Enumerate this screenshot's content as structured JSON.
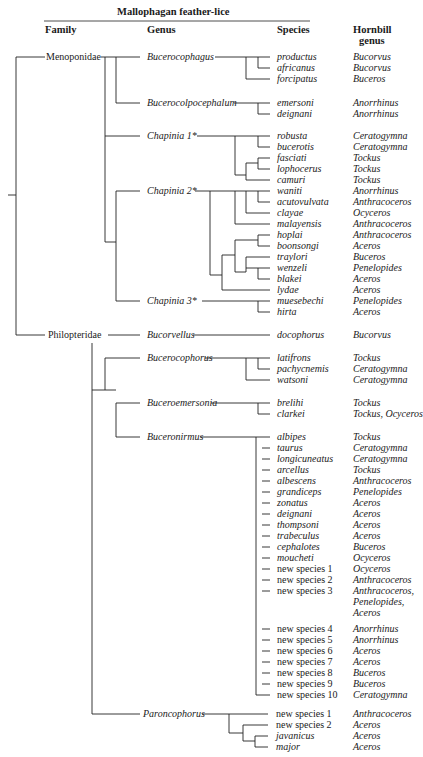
{
  "title": "Mallophagan feather-lice",
  "headers": {
    "family": "Family",
    "genus": "Genus",
    "species": "Species",
    "hornbill_line1": "Hornbill",
    "hornbill_line2": "genus"
  },
  "families": [
    {
      "name": "Menoponidae"
    },
    {
      "name": "Philopteridae"
    }
  ],
  "genera": [
    {
      "name": "Bucerocophagus"
    },
    {
      "name": "Bucerocolpocephalum"
    },
    {
      "name": "Chapinia 1*"
    },
    {
      "name": "Chapinia 2*"
    },
    {
      "name": "Chapinia 3*"
    },
    {
      "name": "Bucorvellus"
    },
    {
      "name": "Bucerocophorus"
    },
    {
      "name": "Buceroemersonia"
    },
    {
      "name": "Buceronirmus"
    },
    {
      "name": "Paroncophorus"
    }
  ],
  "rows": [
    {
      "species": "productus",
      "host": "Bucorvus"
    },
    {
      "species": "africanus",
      "host": "Bucorvus"
    },
    {
      "species": "forcipatus",
      "host": "Buceros"
    },
    {
      "species": "emersoni",
      "host": "Anorrhinus"
    },
    {
      "species": "deignani",
      "host": "Anorrhinus"
    },
    {
      "species": "robusta",
      "host": "Ceratogymna"
    },
    {
      "species": "bucerotis",
      "host": "Ceratogymna"
    },
    {
      "species": "fasciati",
      "host": "Tockus"
    },
    {
      "species": "lophocerus",
      "host": "Tockus"
    },
    {
      "species": "camuri",
      "host": "Tockus"
    },
    {
      "species": "waniti",
      "host": "Anorrhinus"
    },
    {
      "species": "acutovulvata",
      "host": "Anthracoceros"
    },
    {
      "species": "clayae",
      "host": "Ocyceros"
    },
    {
      "species": "malayensis",
      "host": "Anthracoceros"
    },
    {
      "species": "hoplai",
      "host": "Anthracoceros"
    },
    {
      "species": "boonsongi",
      "host": "Aceros"
    },
    {
      "species": "traylori",
      "host": "Buceros"
    },
    {
      "species": "wenzeli",
      "host": "Penelopides"
    },
    {
      "species": "blakei",
      "host": "Aceros"
    },
    {
      "species": "lydae",
      "host": "Aceros"
    },
    {
      "species": "muesebechi",
      "host": "Penelopides"
    },
    {
      "species": "hirta",
      "host": "Aceros"
    },
    {
      "species": "docophorus",
      "host": "Bucorvus"
    },
    {
      "species": "latifrons",
      "host": "Tockus"
    },
    {
      "species": "pachycnemis",
      "host": "Ceratogymna"
    },
    {
      "species": "watsoni",
      "host": "Ceratogymna"
    },
    {
      "species": "brelihi",
      "host": "Tockus"
    },
    {
      "species": "clarkei",
      "host": "Tockus, Ocyceros"
    },
    {
      "species": "albipes",
      "host": "Tockus"
    },
    {
      "species": "taurus",
      "host": "Ceratogymna"
    },
    {
      "species": "longicuneatus",
      "host": "Ceratogymna"
    },
    {
      "species": "arcellus",
      "host": "Tockus"
    },
    {
      "species": "albescens",
      "host": "Anthracoceros"
    },
    {
      "species": "grandiceps",
      "host": "Penelopides"
    },
    {
      "species": "zonatus",
      "host": "Aceros"
    },
    {
      "species": "deignani",
      "host": "Aceros"
    },
    {
      "species": "thompsoni",
      "host": "Aceros"
    },
    {
      "species": "trabeculus",
      "host": "Aceros"
    },
    {
      "species": "cephalotes",
      "host": "Buceros"
    },
    {
      "species": "moucheti",
      "host": "Ocyceros"
    },
    {
      "species": "new species 1",
      "host": "Ocyceros"
    },
    {
      "species": "new species 2",
      "host": "Anthracoceros"
    },
    {
      "species": "new species 3",
      "host": "Anthracoceros,",
      "host2": "Penelopides,",
      "host3": "Aceros"
    },
    {
      "species": "new species 4",
      "host": "Anorrhinus"
    },
    {
      "species": "new species 5",
      "host": "Anorrhinus"
    },
    {
      "species": "new species 6",
      "host": "Aceros"
    },
    {
      "species": "new species 7",
      "host": "Aceros"
    },
    {
      "species": "new species 8",
      "host": "Buceros"
    },
    {
      "species": "new species 9",
      "host": "Buceros"
    },
    {
      "species": "new species 10",
      "host": "Ceratogymna"
    },
    {
      "species": "new species 1",
      "host": "Anthracoceros"
    },
    {
      "species": "new species 2",
      "host": "Aceros"
    },
    {
      "species": "javanicus",
      "host": "Aceros"
    },
    {
      "species": "major",
      "host": "Aceros"
    }
  ]
}
